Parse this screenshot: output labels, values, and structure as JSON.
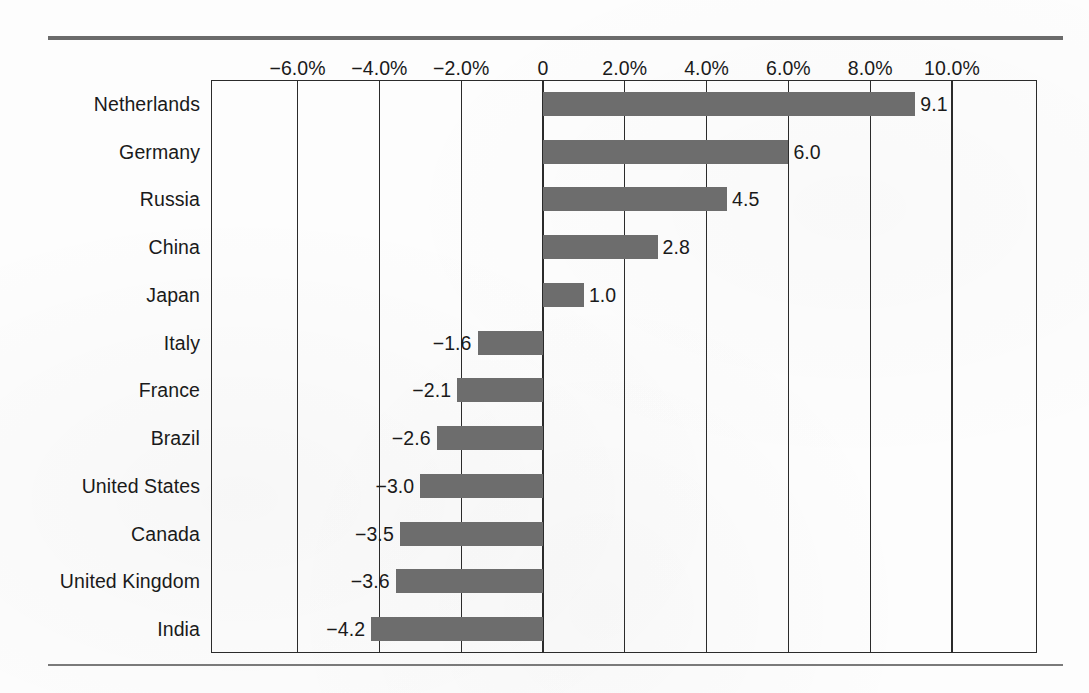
{
  "chart_data": {
    "type": "bar",
    "orientation": "horizontal",
    "title": "",
    "xlabel": "",
    "ylabel": "",
    "xlim": [
      -7.0,
      11.0
    ],
    "grid": true,
    "legend": false,
    "tick_labels": [
      "−6.0%",
      "−4.0%",
      "−2.0%",
      "0",
      "2.0%",
      "4.0%",
      "6.0%",
      "8.0%",
      "10.0%"
    ],
    "tick_values": [
      -6.0,
      -4.0,
      -2.0,
      0,
      2.0,
      4.0,
      6.0,
      8.0,
      10.0
    ],
    "categories": [
      "Netherlands",
      "Germany",
      "Russia",
      "China",
      "Japan",
      "Italy",
      "France",
      "Brazil",
      "United States",
      "Canada",
      "United Kingdom",
      "India"
    ],
    "values": [
      9.1,
      6.0,
      4.5,
      2.8,
      1.0,
      -1.6,
      -2.1,
      -2.6,
      -3.0,
      -3.5,
      -3.6,
      -4.2
    ],
    "data_labels": [
      "9.1",
      "6.0",
      "4.5",
      "2.8",
      "1.0",
      "−1.6",
      "−2.1",
      "−2.6",
      "−3.0",
      "−3.5",
      "−3.6",
      "−4.2"
    ],
    "bar_color": "#6d6d6d",
    "axis_color": "#2b2b2b"
  },
  "rules": {
    "top_color": "#6b6b6b",
    "bottom_color": "#7a7a7a"
  }
}
